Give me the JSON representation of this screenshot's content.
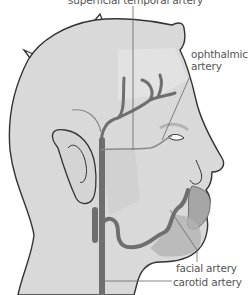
{
  "colors": {
    "skin": "#d9d9d9",
    "skin_shade": "#c8c8c8",
    "lip": "#a6a6a6",
    "artery": "#6e6e6e",
    "outline": "#333333",
    "label_text": "#555555",
    "leader_line": "#666666"
  },
  "labels": [
    {
      "id": "superficial-temporal",
      "text": "superficial temporal artery"
    },
    {
      "id": "ophthalmic",
      "text": "ophthalmic\nartery",
      "line1": "ophthalmic",
      "line2": "artery"
    },
    {
      "id": "facial",
      "text": "facial artery"
    },
    {
      "id": "carotid",
      "text": "carotid artery"
    }
  ]
}
